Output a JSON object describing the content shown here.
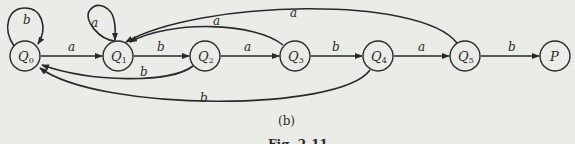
{
  "diagram": {
    "type": "finite-automaton",
    "nodes": [
      {
        "id": "Q0",
        "base": "Q",
        "sub": "0",
        "x": 25,
        "y": 56
      },
      {
        "id": "Q1",
        "base": "Q",
        "sub": "1",
        "x": 118,
        "y": 56
      },
      {
        "id": "Q2",
        "base": "Q",
        "sub": "2",
        "x": 205,
        "y": 56
      },
      {
        "id": "Q3",
        "base": "Q",
        "sub": "3",
        "x": 295,
        "y": 56
      },
      {
        "id": "Q4",
        "base": "Q",
        "sub": "4",
        "x": 378,
        "y": 56
      },
      {
        "id": "Q5",
        "base": "Q",
        "sub": "5",
        "x": 465,
        "y": 56
      },
      {
        "id": "P",
        "base": "P",
        "sub": "",
        "x": 555,
        "y": 56
      }
    ],
    "edges": [
      {
        "from": "Q0",
        "to": "Q0",
        "label": "b"
      },
      {
        "from": "Q0",
        "to": "Q1",
        "label": "a"
      },
      {
        "from": "Q1",
        "to": "Q1",
        "label": "a"
      },
      {
        "from": "Q1",
        "to": "Q2",
        "label": "b"
      },
      {
        "from": "Q2",
        "to": "Q0",
        "label": "b"
      },
      {
        "from": "Q2",
        "to": "Q3",
        "label": "a"
      },
      {
        "from": "Q3",
        "to": "Q1",
        "label": "a"
      },
      {
        "from": "Q3",
        "to": "Q4",
        "label": "b"
      },
      {
        "from": "Q4",
        "to": "Q0",
        "label": "b"
      },
      {
        "from": "Q4",
        "to": "Q5",
        "label": "a"
      },
      {
        "from": "Q5",
        "to": "Q1",
        "label": "a"
      },
      {
        "from": "Q5",
        "to": "P",
        "label": "b"
      }
    ],
    "labels": {
      "q0_loop": "b",
      "q0_q1": "a",
      "q1_loop": "a",
      "q1_q2": "b",
      "q2_q0": "b",
      "q2_q3": "a",
      "q3_q1": "a",
      "q3_q4": "b",
      "q4_q0": "b",
      "q4_q5": "a",
      "q5_q1": "a",
      "q5_p": "b"
    },
    "node_labels": {
      "q0": {
        "base": "Q",
        "sub": "0"
      },
      "q1": {
        "base": "Q",
        "sub": "1"
      },
      "q2": {
        "base": "Q",
        "sub": "2"
      },
      "q3": {
        "base": "Q",
        "sub": "3"
      },
      "q4": {
        "base": "Q",
        "sub": "4"
      },
      "q5": {
        "base": "Q",
        "sub": "5"
      },
      "p": {
        "base": "P",
        "sub": ""
      }
    }
  },
  "caption": {
    "subfigure": "(b)",
    "figure": "Fig. 2-11"
  }
}
